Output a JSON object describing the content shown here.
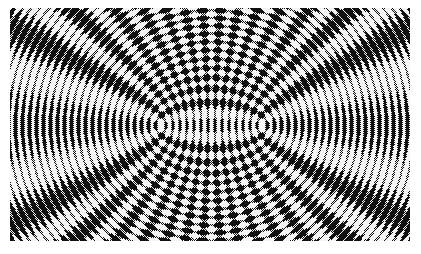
{
  "figure": {
    "canvas": {
      "width": 421,
      "height": 254,
      "background": "#ffffff"
    },
    "pattern_region": {
      "x": 10,
      "y": 8,
      "width": 400,
      "height": 233
    },
    "sources": [
      {
        "name": "left-source",
        "x": 160,
        "y": 125
      },
      {
        "name": "right-source",
        "x": 262,
        "y": 125
      }
    ],
    "wavelength_px": 14,
    "colors": {
      "dark": "#111111",
      "light": "#f4f4f4",
      "mid": "#7a7a7a"
    },
    "halftone_texture": true
  }
}
